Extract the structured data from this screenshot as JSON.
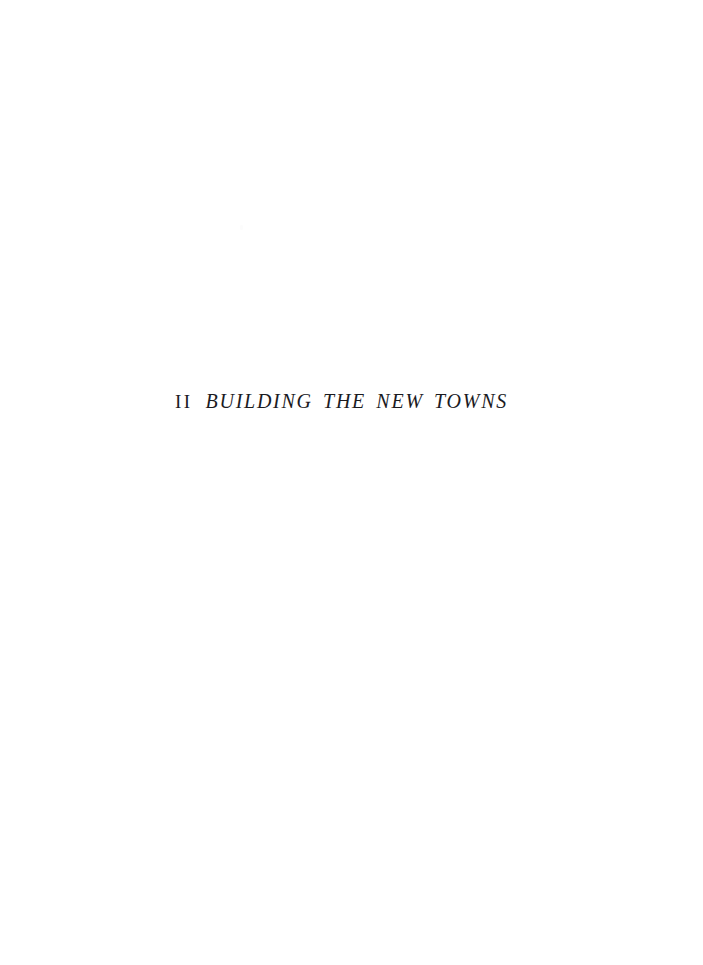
{
  "page": {
    "kind": "book-part-title-page",
    "background_color": "#ffffff",
    "ink_color": "#1b1b1f",
    "width": 703,
    "height": 965
  },
  "part_title": {
    "number": "II",
    "title": "BUILDING THE NEW TOWNS",
    "full_line": "II  BUILDING THE NEW TOWNS"
  }
}
